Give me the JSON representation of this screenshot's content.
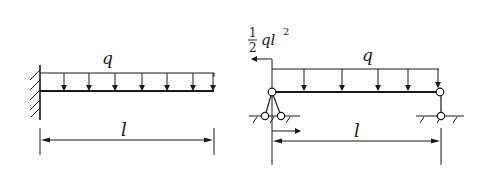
{
  "diagram": {
    "type": "structural-beam-comparison",
    "colors": {
      "stroke": "#1a1a1a",
      "background": "#ffffff"
    },
    "left_figure": {
      "description": "Cantilever beam with fixed support, uniform distributed load",
      "support": "fixed-wall",
      "load_label": "q",
      "span_label": "l",
      "load_arrow_count": 7
    },
    "right_figure": {
      "description": "Simply supported beam with end moment and uniform distributed load",
      "left_support": "pinned (two-bar)",
      "right_support": "roller (single-bar)",
      "moment_label_fraction_num": "1",
      "moment_label_fraction_den": "2",
      "moment_label_expr": "ql",
      "moment_label_exp": "2",
      "load_label": "q",
      "span_label": "l",
      "load_arrow_count": 5
    }
  }
}
